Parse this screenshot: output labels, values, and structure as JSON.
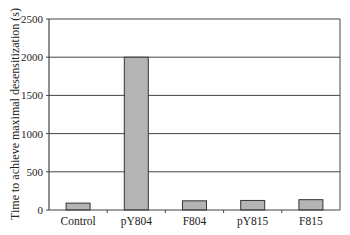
{
  "chart_data": {
    "type": "bar",
    "title": "",
    "xlabel": "",
    "ylabel": "Time to achieve maximal desensitization (s)",
    "categories": [
      "Control",
      "pY804",
      "F804",
      "pY815",
      "F815"
    ],
    "values": [
      90,
      2000,
      120,
      125,
      135
    ],
    "ylim": [
      0,
      2500
    ],
    "yticks": [
      0,
      500,
      1000,
      1500,
      2000,
      2500
    ],
    "ytick_labels": [
      "0",
      "500",
      "1000",
      "1500",
      "2000",
      "2500"
    ],
    "grid": "horizontal",
    "legend": null,
    "colors": {
      "bar_fill": "#b4b4b4",
      "bar_stroke": "#333333",
      "grid": "#444444",
      "axis": "#444444"
    }
  }
}
